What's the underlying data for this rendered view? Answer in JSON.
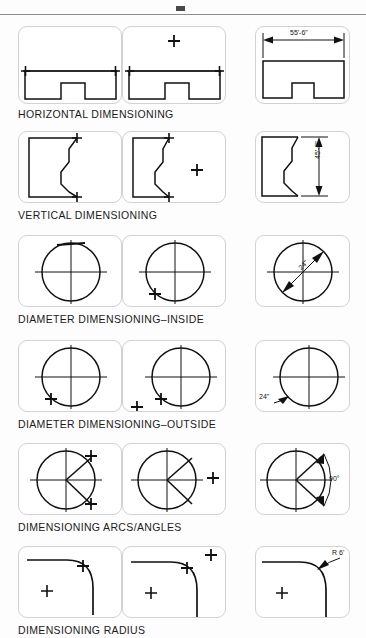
{
  "sheet": {
    "title_rule": "top-divider",
    "background": "#fdfdfd",
    "line_color": "#111111",
    "panel_border_color": "#d2d2d2"
  },
  "rows": [
    {
      "id": "horizontal",
      "caption": "HORIZONTAL DIMENSIONING",
      "dimension_label": "55'-6\"",
      "panels": [
        {
          "step": 1,
          "note": "pick first point on shape"
        },
        {
          "step": 2,
          "note": "pick second point with cursor"
        },
        {
          "step": 3,
          "note": "dimension line placed above shape"
        }
      ]
    },
    {
      "id": "vertical",
      "caption": "VERTICAL DIMENSIONING",
      "dimension_label": "45'-6\"",
      "panels": [
        {
          "step": 1,
          "note": "pick top point"
        },
        {
          "step": 2,
          "note": "pick bottom point with cursor"
        },
        {
          "step": 3,
          "note": "vertical dimension placed at right"
        }
      ]
    },
    {
      "id": "diameter-inside",
      "caption": "DIAMETER DIMENSIONING–INSIDE",
      "dimension_label": "24\"",
      "panels": [
        {
          "step": 1,
          "note": "select circle top quadrant"
        },
        {
          "step": 2,
          "note": "select lower left quadrant"
        },
        {
          "step": 3,
          "note": "diameter dimension inside circle"
        }
      ]
    },
    {
      "id": "diameter-outside",
      "caption": "DIAMETER DIMENSIONING–OUTSIDE",
      "dimension_label": "24\"",
      "panels": [
        {
          "step": 1,
          "note": "select circle"
        },
        {
          "step": 2,
          "note": "place cursor outside circle"
        },
        {
          "step": 3,
          "note": "diameter leader drawn outside"
        }
      ]
    },
    {
      "id": "arcs-angles",
      "caption": "DIMENSIONING ARCS/ANGLES",
      "dimension_label": "90°",
      "panels": [
        {
          "step": 1,
          "note": "pick two radius lines"
        },
        {
          "step": 2,
          "note": "position cursor for arc"
        },
        {
          "step": 3,
          "note": "angular dimension placed"
        }
      ]
    },
    {
      "id": "radius",
      "caption": "DIMENSIONING RADIUS",
      "dimension_label": "R 6'",
      "panels": [
        {
          "step": 1,
          "note": "select fillet arc"
        },
        {
          "step": 2,
          "note": "position cursor outside"
        },
        {
          "step": 3,
          "note": "radius leader placed"
        }
      ]
    }
  ]
}
